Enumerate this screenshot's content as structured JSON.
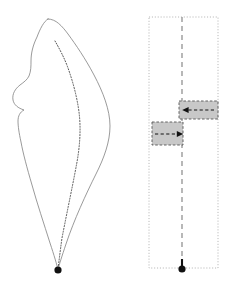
{
  "figure": {
    "name": "two-panel-geometry-diagram",
    "width": 225,
    "height": 285,
    "background": "#ffffff",
    "colors": {
      "outline": "#808080",
      "dotted_curve": "#4d4d4d",
      "panel_border": "#b3b3b3",
      "center_axis": "#999999",
      "box_fill": "#c8c8c8",
      "box_border": "#555555",
      "arrow": "#111111",
      "marker": "#111111"
    },
    "stroke_widths": {
      "outline": 0.8,
      "dotted_curve": 0.9,
      "panel_border": 0.9,
      "center_axis": 1.3,
      "box_border": 0.9,
      "arrow": 1.4
    }
  },
  "left_panel": {
    "name": "teardrop-outline-panel",
    "solid_outline": {
      "label": "outer-teardrop-outline",
      "style": "solid",
      "closed": true,
      "apex": [
        48,
        19
      ],
      "tip": [
        58,
        270
      ],
      "extremes": {
        "left_x": 13,
        "right_x": 110,
        "top_y": 19,
        "bottom_y": 270
      },
      "path": "M 48 19 C 56 19 62 26 68 34 C 76 45 85 58 94 75 C 103 92 110 110 110 126 C 110 142 104 158 96 174 C 86 194 74 220 66 244 C 62 256 59 265 58 270 C 57 265 54 255 50 243 C 44 224 37 203 32 185 C 27 168 23 153 21 142 C 19 133 18 126 18 121 C 18 116 20 112 24 110 C 18 108 14 105 13 100 C 12 94 15 89 20 85 C 24 82 27 80 29 76 C 31 71 31 66 31 61 C 31 53 33 45 37 37 C 40 29 44 21 48 19 Z"
    },
    "dotted_curve": {
      "label": "inner-dotted-curve",
      "style": "dotted",
      "start": [
        55,
        41
      ],
      "end": [
        58,
        268
      ],
      "path": "M 55 41 C 59 48 64 57 68 68 C 73 82 77 97 79 112 C 81 128 80 145 77 162 C 73 184 67 212 62 238 C 60 252 59 262 58 268"
    },
    "tip_marker": {
      "label": "convergence-point-marker",
      "shape": "filled-circle",
      "center": [
        58,
        270
      ],
      "radius": 3.6
    }
  },
  "right_panel": {
    "name": "rectangular-strip-panel",
    "frame": {
      "label": "dotted-rectangle-frame",
      "style": "dotted",
      "x": 149,
      "y": 17,
      "width": 69,
      "height": 251
    },
    "center_axis": {
      "label": "vertical-dashed-axis",
      "style": "dashed",
      "x": 182,
      "y_start": 17,
      "y_end": 268
    },
    "blocks": [
      {
        "label": "upper-shifted-block",
        "x": 179,
        "y": 101,
        "width": 39,
        "height": 18,
        "fill": "#c8c8c8",
        "border_style": "dashed",
        "arrow": {
          "label": "leftward-arrow",
          "direction": "left",
          "style": "dashed",
          "from": [
            214,
            110
          ],
          "to": [
            183,
            110
          ]
        }
      },
      {
        "label": "lower-shifted-block",
        "x": 152,
        "y": 122,
        "width": 31,
        "height": 23,
        "fill": "#c8c8c8",
        "border_style": "dashed",
        "arrow": {
          "label": "rightward-arrow",
          "direction": "right",
          "style": "dashed",
          "from": [
            155,
            134
          ],
          "to": [
            181,
            134
          ]
        }
      }
    ],
    "base_marker": {
      "label": "axis-base-marker",
      "shape": "filled-circle-with-stem",
      "center": [
        182,
        269
      ],
      "radius": 3.6,
      "stem_top": [
        182,
        259
      ]
    }
  },
  "labels": {
    "title": "",
    "left_caption": "",
    "right_caption": "",
    "annotations": []
  }
}
